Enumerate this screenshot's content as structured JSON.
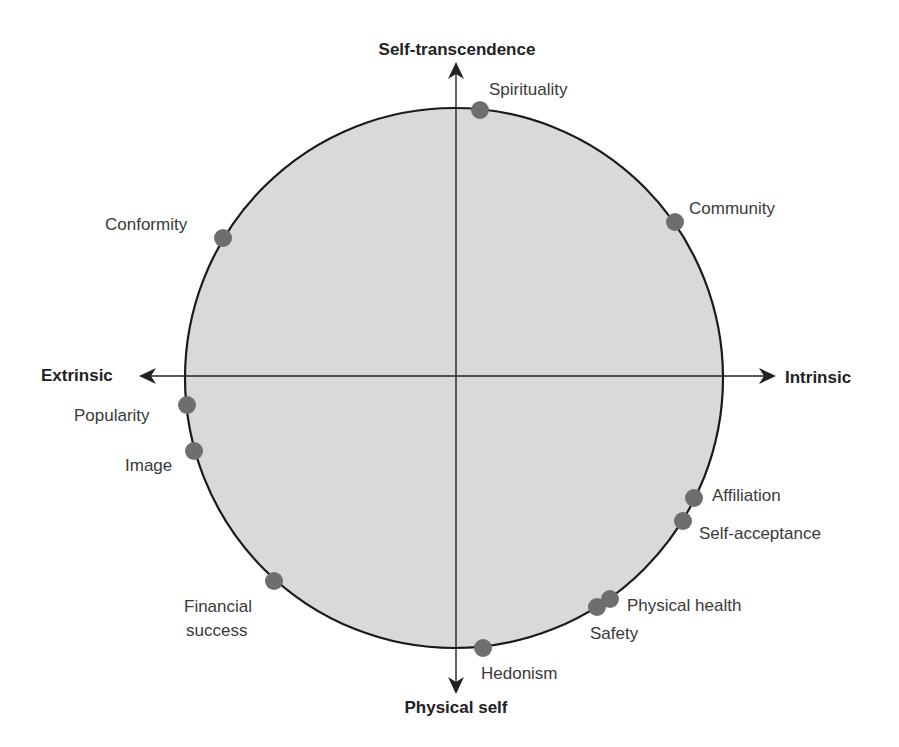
{
  "diagram": {
    "colors": {
      "background": "#ffffff",
      "circle_fill": "#d9d9d9",
      "circle_stroke": "#1a1a1a",
      "axis": "#222222",
      "dot": "#6e6e6e",
      "text": "#3a3a3a",
      "axis_text": "#222222"
    },
    "axes": {
      "top": "Self-transcendence",
      "bottom": "Physical self",
      "left": "Extrinsic",
      "right": "Intrinsic"
    },
    "goals": [
      {
        "id": "spirituality",
        "label": "Spirituality",
        "x": 480,
        "y": 110
      },
      {
        "id": "community",
        "label": "Community",
        "x": 675,
        "y": 222
      },
      {
        "id": "conformity",
        "label": "Conformity",
        "x": 223,
        "y": 238
      },
      {
        "id": "popularity",
        "label": "Popularity",
        "x": 187,
        "y": 405
      },
      {
        "id": "image",
        "label": "Image",
        "x": 194,
        "y": 451
      },
      {
        "id": "affiliation",
        "label": "Affiliation",
        "x": 694,
        "y": 498
      },
      {
        "id": "self-acceptance",
        "label": "Self-acceptance",
        "x": 683,
        "y": 521
      },
      {
        "id": "financial-success",
        "label": "Financial success",
        "line1": "Financial",
        "line2": "success",
        "x": 274,
        "y": 581
      },
      {
        "id": "physical-health",
        "label": "Physical health",
        "x": 610,
        "y": 599
      },
      {
        "id": "safety",
        "label": "Safety",
        "x": 597,
        "y": 607
      },
      {
        "id": "hedonism",
        "label": "Hedonism",
        "x": 483,
        "y": 648
      }
    ]
  }
}
